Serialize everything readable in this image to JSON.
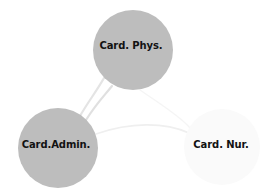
{
  "graph": {
    "background_color": "#ffffff",
    "label_color": "#121212",
    "nodes": [
      {
        "id": "card-phys",
        "label": "Card. Phys.",
        "cx": 133,
        "cy": 50,
        "r": 40,
        "fill": "#bdbdbd",
        "label_x": 131,
        "label_y": 46
      },
      {
        "id": "card-admin",
        "label": "Card.Admin.",
        "cx": 58,
        "cy": 148,
        "r": 40,
        "fill": "#bdbdbd",
        "label_x": 56,
        "label_y": 145
      },
      {
        "id": "card-nur",
        "label": "Card. Nur.",
        "cx": 222,
        "cy": 147,
        "r": 38,
        "fill": "#fafafa",
        "label_x": 221,
        "label_y": 145
      }
    ],
    "edges": [
      {
        "id": "edge-phys-admin-a",
        "source": "card-phys",
        "target": "card-admin",
        "stroke": "#e4e4e4",
        "width": 2.2,
        "path": "M 104 78 C 96 92 88 102 80 116"
      },
      {
        "id": "edge-phys-admin-b",
        "source": "card-phys",
        "target": "card-admin",
        "stroke": "#e0e0e0",
        "width": 2.2,
        "path": "M 112 86 C 104 96 96 104 86 120"
      },
      {
        "id": "edge-admin-nur",
        "source": "card-admin",
        "target": "card-nur",
        "stroke": "#efefef",
        "width": 1.6,
        "path": "M 96 134 C 130 122 165 122 189 133"
      },
      {
        "id": "edge-phys-nur",
        "source": "card-phys",
        "target": "card-nur",
        "stroke": "#f5f5f5",
        "width": 1.4,
        "path": "M 140 90 C 160 104 180 116 190 128"
      }
    ]
  }
}
